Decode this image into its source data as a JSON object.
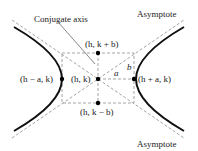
{
  "diagram": {
    "labels": {
      "conjugate_axis": "Conjugate axis",
      "asymptote_top": "Asymptote",
      "asymptote_bottom": "Asymptote",
      "center": "(h, k)",
      "top_point": "(h, k + b)",
      "bottom_point": "(h, k − b)",
      "left_vertex": "(h − a, k)",
      "right_vertex": "(h + a, k)",
      "a": "a",
      "b": "b"
    },
    "colors": {
      "curve": "#111111",
      "dashed": "#9a9a9a",
      "text": "#222222"
    }
  }
}
